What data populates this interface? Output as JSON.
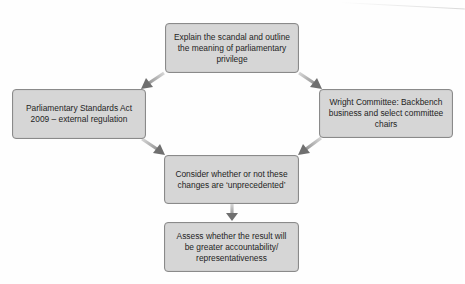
{
  "diagram": {
    "type": "flowchart",
    "colors": {
      "box_fill": "#d6d6d6",
      "box_border": "#8a8a8a",
      "arrow_light": "#d0d0d0",
      "arrow_dark": "#6f6f6f",
      "text": "#1e1e1e"
    },
    "nodes": [
      {
        "id": "top",
        "lines": [
          "Explain the scandal and outline",
          "the meaning of parliamentary",
          "privilege"
        ]
      },
      {
        "id": "left",
        "lines": [
          "Parliamentary Standards Act",
          "2009 – external regulation"
        ]
      },
      {
        "id": "right",
        "lines": [
          "Wright Committee: Backbench",
          "business and select committee",
          "chairs"
        ]
      },
      {
        "id": "middle",
        "lines": [
          "Consider whether or not these",
          "changes are ‘unprecedented’"
        ]
      },
      {
        "id": "bottom",
        "lines": [
          "Assess whether the result will",
          "be greater accountability/",
          "representativeness"
        ]
      }
    ],
    "edges": [
      {
        "from": "top",
        "to": "left"
      },
      {
        "from": "top",
        "to": "right"
      },
      {
        "from": "left",
        "to": "middle"
      },
      {
        "from": "right",
        "to": "middle"
      },
      {
        "from": "middle",
        "to": "bottom"
      }
    ]
  }
}
